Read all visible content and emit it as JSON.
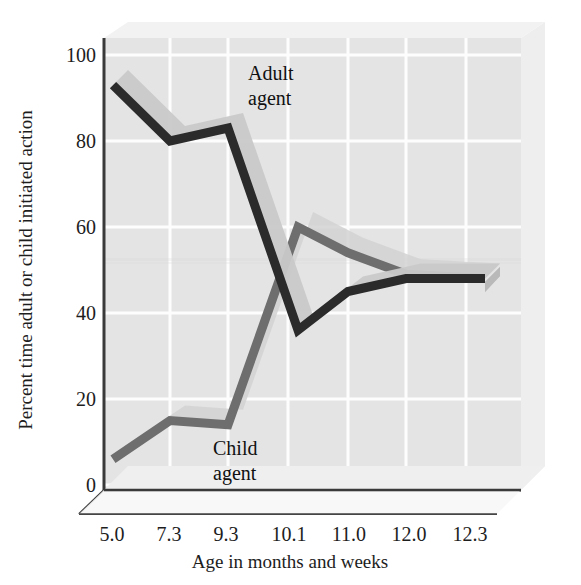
{
  "chart_data": {
    "type": "line",
    "title": "",
    "xlabel": "Age in months and weeks",
    "ylabel": "Percent time adult or child initiated action",
    "categories": [
      "5.0",
      "7.3",
      "9.3",
      "10.1",
      "11.0",
      "12.0",
      "12.3"
    ],
    "ylim": [
      0,
      100
    ],
    "yticks": [
      "0",
      "20",
      "40",
      "60",
      "80",
      "100"
    ],
    "grid": true,
    "legend_position": "inline-annotation",
    "style": "3d-ribbon-lines",
    "series": [
      {
        "name": "Adult agent",
        "color": "#2b2b2b",
        "values": [
          93,
          80,
          83,
          36,
          45,
          48,
          48
        ]
      },
      {
        "name": "Child agent",
        "color": "#6e6e6e",
        "values": [
          6,
          15,
          14,
          60,
          54,
          49,
          48
        ]
      }
    ],
    "annotations": [
      {
        "text_line1": "Adult",
        "text_line2": "agent",
        "series": "Adult agent"
      },
      {
        "text_line1": "Child",
        "text_line2": "agent",
        "series": "Child agent"
      }
    ]
  },
  "axes": {
    "y_tick_0": "0",
    "y_tick_20": "20",
    "y_tick_40": "40",
    "y_tick_60": "60",
    "y_tick_80": "80",
    "y_tick_100": "100",
    "x_tick_0": "5.0",
    "x_tick_1": "7.3",
    "x_tick_2": "9.3",
    "x_tick_3": "10.1",
    "x_tick_4": "11.0",
    "x_tick_5": "12.0",
    "x_tick_6": "12.3",
    "x_title": "Age in months and weeks",
    "y_title": "Percent time adult or child initiated action"
  },
  "labels": {
    "adult_line1": "Adult",
    "adult_line2": "agent",
    "child_line1": "Child",
    "child_line2": "agent"
  },
  "colors": {
    "plot_background": "#e4e4e4",
    "gridline": "#fdfdfd",
    "adult_line": "#2b2b2b",
    "adult_ribbon_top": "#c9c9c9",
    "child_line": "#6e6e6e",
    "child_ribbon_top": "#d2d2d2",
    "axis_line": "#3a3a3a",
    "floor": "#efefef",
    "text": "#1d1d1d"
  }
}
